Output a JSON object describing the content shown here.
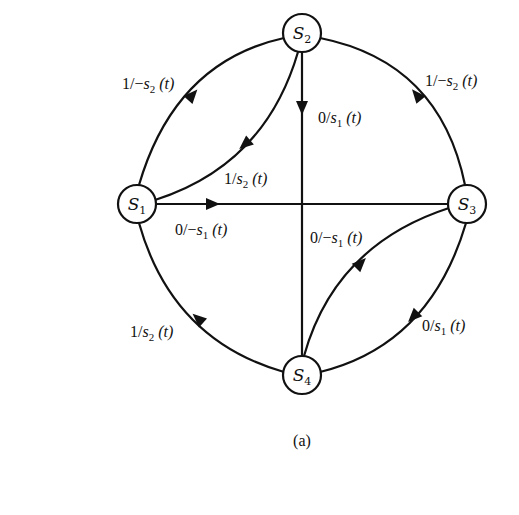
{
  "figure": {
    "caption": "(a)",
    "colors": {
      "stroke": "#111111",
      "background": "#ffffff"
    }
  },
  "nodes": [
    {
      "id": "S1",
      "name": "S",
      "sub": "1",
      "x": 137,
      "y": 204
    },
    {
      "id": "S2",
      "name": "S",
      "sub": "2",
      "x": 302,
      "y": 33
    },
    {
      "id": "S3",
      "name": "S",
      "sub": "3",
      "x": 467,
      "y": 204
    },
    {
      "id": "S4",
      "name": "S",
      "sub": "4",
      "x": 302,
      "y": 375
    }
  ],
  "edges": [
    {
      "from": "S1",
      "to": "S2",
      "type": "outer-arc",
      "label": {
        "pre": "1/−",
        "var": "s",
        "sub": "2",
        "post": " (t)"
      }
    },
    {
      "from": "S2",
      "to": "S1",
      "type": "inner-arc",
      "label": {
        "pre": "1/",
        "var": "s",
        "sub": "2",
        "post": " (t)"
      }
    },
    {
      "from": "S2",
      "to": "S4",
      "type": "straight",
      "label": {
        "pre": "0/",
        "var": "s",
        "sub": "1",
        "post": " (t)"
      }
    },
    {
      "from": "S1",
      "to": "S3",
      "type": "straight",
      "label": {
        "pre": "0/−",
        "var": "s",
        "sub": "1",
        "post": " (t)"
      }
    },
    {
      "from": "S3",
      "to": "S2",
      "type": "outer-arc",
      "label": {
        "pre": "1/−",
        "var": "s",
        "sub": "2",
        "post": " (t)"
      }
    },
    {
      "from": "S4",
      "to": "S3",
      "type": "inner-arc",
      "label": {
        "pre": "0/−",
        "var": "s",
        "sub": "1",
        "post": " (t)"
      }
    },
    {
      "from": "S3",
      "to": "S4",
      "type": "outer-arc",
      "label": {
        "pre": "0/",
        "var": "s",
        "sub": "1",
        "post": " (t)"
      }
    },
    {
      "from": "S4",
      "to": "S1",
      "type": "outer-arc",
      "label": {
        "pre": "1/",
        "var": "s",
        "sub": "2",
        "post": " (t)"
      }
    }
  ]
}
